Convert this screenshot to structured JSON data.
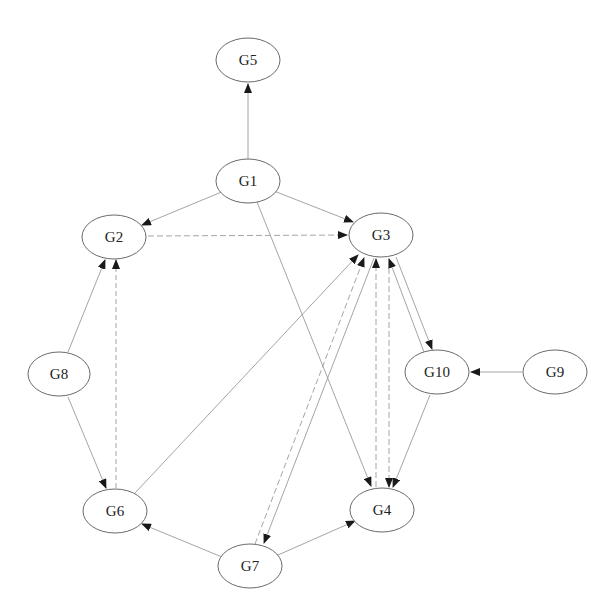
{
  "diagram": {
    "type": "directed-graph",
    "nodes": [
      {
        "id": "G5",
        "label": "G5",
        "cx": 248,
        "cy": 60
      },
      {
        "id": "G1",
        "label": "G1",
        "cx": 248,
        "cy": 181
      },
      {
        "id": "G2",
        "label": "G2",
        "cx": 114,
        "cy": 237
      },
      {
        "id": "G3",
        "label": "G3",
        "cx": 381,
        "cy": 235
      },
      {
        "id": "G8",
        "label": "G8",
        "cx": 59,
        "cy": 374
      },
      {
        "id": "G10",
        "label": "G10",
        "cx": 437,
        "cy": 372
      },
      {
        "id": "G9",
        "label": "G9",
        "cx": 555,
        "cy": 372
      },
      {
        "id": "G6",
        "label": "G6",
        "cx": 115,
        "cy": 511
      },
      {
        "id": "G4",
        "label": "G4",
        "cx": 382,
        "cy": 510
      },
      {
        "id": "G7",
        "label": "G7",
        "cx": 250,
        "cy": 566
      }
    ],
    "edges": [
      {
        "from": "G1",
        "to": "G5"
      },
      {
        "from": "G1",
        "to": "G2"
      },
      {
        "from": "G1",
        "to": "G3"
      },
      {
        "from": "G1",
        "to": "G4"
      },
      {
        "from": "G2",
        "to": "G3"
      },
      {
        "from": "G8",
        "to": "G2"
      },
      {
        "from": "G8",
        "to": "G6"
      },
      {
        "from": "G6",
        "to": "G2"
      },
      {
        "from": "G6",
        "to": "G3"
      },
      {
        "from": "G7",
        "to": "G6"
      },
      {
        "from": "G7",
        "to": "G4"
      },
      {
        "from": "G7",
        "to": "G3"
      },
      {
        "from": "G3",
        "to": "G7"
      },
      {
        "from": "G4",
        "to": "G3"
      },
      {
        "from": "G3",
        "to": "G4"
      },
      {
        "from": "G3",
        "to": "G10"
      },
      {
        "from": "G10",
        "to": "G3"
      },
      {
        "from": "G10",
        "to": "G4"
      },
      {
        "from": "G9",
        "to": "G10"
      }
    ],
    "colors": {
      "node_stroke": "#6a6a6a",
      "edge_stroke": "#9a9a9a",
      "arrowhead": "#1a1a1a",
      "label": "#222222"
    }
  }
}
